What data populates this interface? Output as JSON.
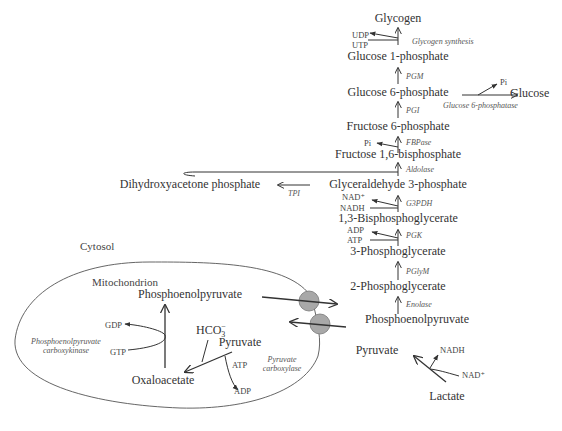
{
  "compartments": {
    "cytosol": "Cytosol",
    "mitochondrion": "Mitochondrion"
  },
  "metabolites": {
    "glycogen": "Glycogen",
    "glucose_1p": "Glucose 1-phosphate",
    "glucose_6p": "Glucose 6-phosphate",
    "glucose": "Glucose",
    "fructose_6p": "Fructose 6-phosphate",
    "fructose_16bp": "Fructose 1,6-bisphosphate",
    "dhap": "Dihydroxyacetone phosphate",
    "g3p": "Glyceraldehyde 3-phosphate",
    "bpg13": "1,3-Bisphosphoglycerate",
    "pg3": "3-Phosphoglycerate",
    "pg2": "2-Phosphoglycerate",
    "pep_cyto": "Phosphoenolpyruvate",
    "pyruvate_cyto": "Pyruvate",
    "lactate": "Lactate",
    "pep_mito": "Phosphoenolpyruvate",
    "pyruvate_mito": "Pyruvate",
    "oxaloacetate": "Oxaloacetate",
    "bicarbonate": "HCO",
    "bicarbonate_sub": "3",
    "bicarbonate_sup": "−"
  },
  "enzymes": {
    "glycogen_synthesis": "Glycogen synthesis",
    "pgm": "PGM",
    "g6pase": "Glucose 6-phosphatase",
    "pgi": "PGI",
    "fbpase": "FBPase",
    "aldolase": "Aldolase",
    "tpi": "TPI",
    "g3pdh": "G3PDH",
    "pgk": "PGK",
    "pglym": "PGlyM",
    "enolase": "Enolase",
    "pepck_line1": "Phosphoenolpyruvate",
    "pepck_line2": "carboxykinase",
    "pc_line1": "Pyruvate",
    "pc_line2": "carboxylase"
  },
  "cofactors": {
    "udp": "UDP",
    "utp": "UTP",
    "pi_g6p": "Pi",
    "pi_fbp": "Pi",
    "nad_plus_g3p": "NAD⁺",
    "nadh_g3p": "NADH",
    "adp_pgk": "ADP",
    "atp_pgk": "ATP",
    "gdp": "GDP",
    "gtp": "GTP",
    "atp_pc": "ATP",
    "adp_pc": "ADP",
    "nadh_ldh": "NADH",
    "nad_plus_ldh": "NAD⁺"
  },
  "colors": {
    "text": "#333333",
    "line": "#333333",
    "membrane": "#555555",
    "transporter_fill": "#a8a8a8"
  }
}
